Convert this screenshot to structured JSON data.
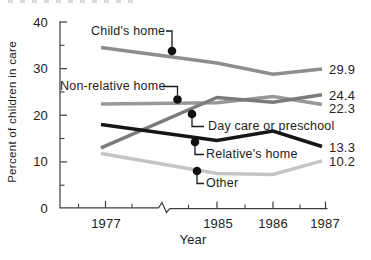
{
  "chart_data": {
    "type": "line",
    "title": "",
    "x": [
      "1977",
      "1985",
      "1986",
      "1987"
    ],
    "x_axis_break_after_index": 0,
    "xlabel": "Year",
    "ylabel": "Percent of children in care",
    "ylim": [
      0,
      40
    ],
    "yticks": [
      0,
      10,
      20,
      30,
      40
    ],
    "ytick_labels": [
      "40",
      "30",
      "20",
      "10",
      "0"
    ],
    "grid": false,
    "legend": "inline-callouts-with-dots",
    "series": [
      {
        "name": "Child's home",
        "values": [
          34.5,
          31.2,
          28.8,
          29.9
        ],
        "end_label": "29.9",
        "color": "#8e8e8e"
      },
      {
        "name": "Non-relative home",
        "values": [
          22.4,
          22.7,
          24.0,
          22.3
        ],
        "end_label": "22.3",
        "color": "#989898"
      },
      {
        "name": "Day care or preschool",
        "values": [
          13.0,
          23.8,
          22.8,
          24.4
        ],
        "end_label": "24.4",
        "color": "#7b7b7b"
      },
      {
        "name": "Relative's home",
        "values": [
          18.0,
          14.6,
          16.6,
          13.3
        ],
        "end_label": "13.3",
        "color": "#161616"
      },
      {
        "name": "Other",
        "values": [
          11.8,
          7.5,
          7.3,
          10.2
        ],
        "end_label": "10.2",
        "color": "#c5c5c5"
      }
    ],
    "callout_dot_color": "#111111",
    "axis_color": "#3c3c3c"
  }
}
